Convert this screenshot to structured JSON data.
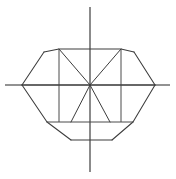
{
  "figure": {
    "canvas_width": 176,
    "canvas_height": 179,
    "background_color": "#ffffff",
    "axis_color": "#6e6e6e",
    "outline_color": "#3c3c3c"
  },
  "chart_data": {
    "type": "line",
    "xlabel": "",
    "ylabel": "",
    "grid": false,
    "legend": null,
    "origin": {
      "x": 90,
      "y": 85
    },
    "axes": {
      "x_axis": {
        "x1": 5,
        "y1": 85,
        "x2": 170,
        "y2": 85
      },
      "y_axis": {
        "x1": 90,
        "y1": 7,
        "x2": 90,
        "y2": 172
      }
    },
    "key_points": {
      "left_vertex": {
        "x": 22,
        "y": 85
      },
      "right_vertex": {
        "x": 155,
        "y": 85
      },
      "top_left_shoulder": {
        "x": 44,
        "y": 52
      },
      "top_right_shoulder": {
        "x": 134,
        "y": 52
      },
      "crown_left": {
        "x": 59,
        "y": 49
      },
      "crown_right": {
        "x": 121,
        "y": 49
      },
      "pavilion_left": {
        "x": 59,
        "y": 122
      },
      "pavilion_right": {
        "x": 121,
        "y": 122
      },
      "culet_left": {
        "x": 71,
        "y": 140
      },
      "culet_right": {
        "x": 112,
        "y": 140
      },
      "lower_left_bend": {
        "x": 47,
        "y": 122
      },
      "lower_right_bend": {
        "x": 133,
        "y": 122
      }
    },
    "series": [
      {
        "name": "crown-top-edge",
        "points": [
          [
            44,
            52
          ],
          [
            59,
            49
          ],
          [
            121,
            49
          ],
          [
            134,
            52
          ]
        ]
      },
      {
        "name": "upper-left-facet",
        "points": [
          [
            22,
            85
          ],
          [
            44,
            52
          ]
        ]
      },
      {
        "name": "upper-right-facet",
        "points": [
          [
            155,
            85
          ],
          [
            134,
            52
          ]
        ]
      },
      {
        "name": "lower-left-facet",
        "points": [
          [
            22,
            85
          ],
          [
            47,
            122
          ]
        ]
      },
      {
        "name": "lower-right-facet",
        "points": [
          [
            155,
            85
          ],
          [
            133,
            122
          ]
        ]
      },
      {
        "name": "pavilion-left-edge",
        "points": [
          [
            47,
            122
          ],
          [
            71,
            140
          ]
        ]
      },
      {
        "name": "pavilion-right-edge",
        "points": [
          [
            133,
            122
          ],
          [
            112,
            140
          ]
        ]
      },
      {
        "name": "culet-bottom-edge",
        "points": [
          [
            71,
            140
          ],
          [
            112,
            140
          ]
        ]
      },
      {
        "name": "girdle-left-vertical",
        "points": [
          [
            59,
            49
          ],
          [
            59,
            122
          ]
        ]
      },
      {
        "name": "girdle-right-vertical",
        "points": [
          [
            121,
            49
          ],
          [
            121,
            122
          ]
        ]
      },
      {
        "name": "girdle-lower-horizontal",
        "points": [
          [
            47,
            122
          ],
          [
            133,
            122
          ]
        ]
      },
      {
        "name": "ray-upper-left",
        "points": [
          [
            90,
            85
          ],
          [
            59,
            49
          ]
        ]
      },
      {
        "name": "ray-upper-right",
        "points": [
          [
            90,
            85
          ],
          [
            121,
            49
          ]
        ]
      },
      {
        "name": "ray-lower-left",
        "points": [
          [
            90,
            85
          ],
          [
            71,
            122
          ]
        ]
      },
      {
        "name": "ray-lower-right",
        "points": [
          [
            90,
            85
          ],
          [
            110,
            122
          ]
        ]
      },
      {
        "name": "ray-left-horizontal",
        "points": [
          [
            90,
            85
          ],
          [
            22,
            85
          ]
        ]
      },
      {
        "name": "ray-right-horizontal",
        "points": [
          [
            90,
            85
          ],
          [
            155,
            85
          ]
        ]
      }
    ]
  }
}
